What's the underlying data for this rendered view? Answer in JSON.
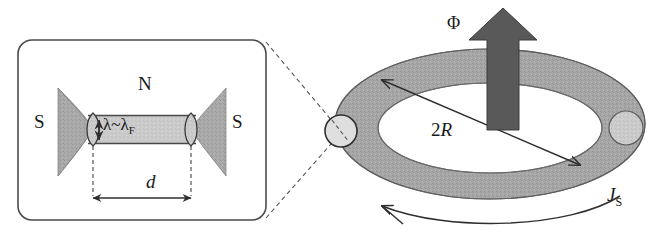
{
  "figure": {
    "colors": {
      "electrode_gray": "#9e9e9e",
      "channel_gray": "#c9c9c9",
      "ring_gray": "#a8a8a8",
      "arrow_dark": "#595959",
      "junction_light": "#dcdcdc",
      "outline": "#3a3a3a",
      "dashed": "#555555",
      "background": "#ffffff"
    }
  },
  "left_panel": {
    "name": "junction-detail-panel",
    "labels": {
      "superconductor_left": "S",
      "superconductor_right": "S",
      "normal_region": "N",
      "width_label": "λ~λ",
      "width_label_sub": "F",
      "length_label": "d"
    },
    "annotations": {
      "vertical_arrow": "double-headed-vertical-arrow",
      "horizontal_arrow": "double-headed-horizontal-arrow"
    }
  },
  "right_panel": {
    "name": "ring-geometry-panel",
    "labels": {
      "flux": "Φ",
      "diameter": "2",
      "diameter_italic": "R",
      "supercurrent": "J",
      "supercurrent_sub": "S"
    },
    "annotations": {
      "flux_arrow": "thick-up-arrow",
      "diameter_arrow": "double-headed-diagonal-arrow",
      "current_arrow": "curved-counterclockwise-arrow",
      "junction_left": "weak-link-junction-circle",
      "junction_right": "weak-link-junction-circle"
    }
  },
  "connector": {
    "name": "zoom-callout-dashed-lines",
    "style": "dashed"
  }
}
